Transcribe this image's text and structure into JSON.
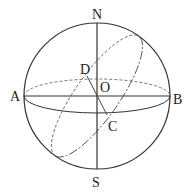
{
  "diagram": {
    "type": "sphere-geometry",
    "labels": {
      "north": "N",
      "south": "S",
      "west": "A",
      "east": "B",
      "center": "O",
      "point_d": "D",
      "point_c": "C"
    },
    "colors": {
      "stroke": "#333333",
      "dashed": "#666666",
      "background": "#ffffff"
    }
  }
}
